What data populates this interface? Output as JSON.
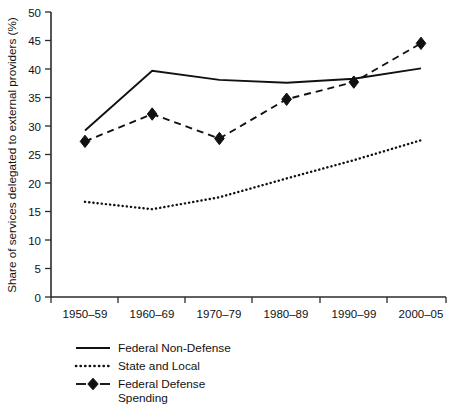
{
  "chart_data": {
    "type": "line",
    "title": "",
    "xlabel": "",
    "ylabel": "Share of services delegated to external providers (%)",
    "categories": [
      "1950–59",
      "1960–69",
      "1970–79",
      "1980–89",
      "1990–99",
      "2000–05"
    ],
    "ylim": [
      0,
      50
    ],
    "yticks": [
      0,
      5,
      10,
      15,
      20,
      25,
      30,
      35,
      40,
      45,
      50
    ],
    "ytick_labels": [
      "0",
      "5",
      "10",
      "15",
      "20",
      "25",
      "30",
      "35",
      "40",
      "45",
      "50"
    ],
    "grid": false,
    "legend_position": "below-axes-left",
    "series": [
      {
        "name": "Federal Non-Defense",
        "style": "solid",
        "marker": "none",
        "color": "#111111",
        "values": [
          29.2,
          39.7,
          38.1,
          37.6,
          38.3,
          40.1
        ]
      },
      {
        "name": "State and Local",
        "style": "dotted",
        "marker": "none",
        "color": "#111111",
        "values": [
          16.7,
          15.4,
          17.5,
          20.8,
          24.0,
          27.5
        ]
      },
      {
        "name": "Federal Defense Spending",
        "style": "dashed",
        "marker": "diamond",
        "color": "#111111",
        "values": [
          27.3,
          32.1,
          27.8,
          34.7,
          37.7,
          44.5
        ]
      }
    ]
  },
  "legend": {
    "entries": [
      {
        "label": "Federal Non-Defense",
        "style": "solid"
      },
      {
        "label": "State and Local",
        "style": "dotted"
      },
      {
        "label": "Federal Defense",
        "style": "dashed-diamond"
      },
      {
        "label": "Spending",
        "style": "continuation"
      }
    ]
  },
  "caption": {
    "text": ""
  }
}
